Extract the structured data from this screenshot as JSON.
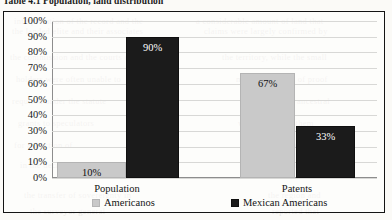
{
  "caption": "Table 4.1  Population, land distribution",
  "chart_data": {
    "type": "bar",
    "title": "",
    "xlabel": "",
    "ylabel": "",
    "categories": [
      "Population",
      "Patents"
    ],
    "series": [
      {
        "name": "Americanos",
        "color": "#c9c9c9",
        "values": [
          10,
          67
        ],
        "labels": [
          "10%",
          "67%"
        ]
      },
      {
        "name": "Mexican Americans",
        "color": "#1b1b1b",
        "values": [
          90,
          33
        ],
        "labels": [
          "90%",
          "33%"
        ]
      }
    ],
    "ylim": [
      0,
      100
    ],
    "ytick_labels": [
      "100%",
      "90%",
      "80%",
      "70%",
      "60%",
      "50%",
      "40%",
      "30%",
      "20%",
      "10%",
      "0%"
    ],
    "ytick_values": [
      100,
      90,
      80,
      70,
      60,
      50,
      40,
      30,
      20,
      10,
      0
    ],
    "grid": true,
    "legend_position": "bottom"
  },
  "ghost_text": [
    {
      "t": "interpretation of the record and the",
      "x": 14,
      "y": 16
    },
    {
      "t": "a considerable amount of land that",
      "x": 196,
      "y": 16
    },
    {
      "t": "the landed elite and their associates",
      "x": 12,
      "y": 26
    },
    {
      "t": "claims were largely confirmed by",
      "x": 204,
      "y": 26
    },
    {
      "t": "the commission and the courts of",
      "x": 10,
      "y": 52
    },
    {
      "t": "the territory, while the small",
      "x": 222,
      "y": 52
    },
    {
      "t": "holders were often unable to",
      "x": 16,
      "y": 74
    },
    {
      "t": "meet the burden of proof",
      "x": 236,
      "y": 74
    },
    {
      "t": "required under the statute",
      "x": 12,
      "y": 96
    },
    {
      "t": "and lost their ancestral",
      "x": 246,
      "y": 96
    },
    {
      "t": "grants to speculators",
      "x": 18,
      "y": 118
    },
    {
      "t": "who purchased them",
      "x": 238,
      "y": 118
    },
    {
      "t": "for a fraction of",
      "x": 14,
      "y": 140
    },
    {
      "t": "their actual worth",
      "x": 244,
      "y": 140
    },
    {
      "t": "in the decades",
      "x": 20,
      "y": 160
    },
    {
      "t": "that followed",
      "x": 250,
      "y": 160
    },
    {
      "t": "the transfer of sovereignty in",
      "x": 24,
      "y": 190
    },
    {
      "t": "the region and",
      "x": 268,
      "y": 190
    },
    {
      "t": "the surveyor general",
      "x": 30,
      "y": 206
    },
    {
      "t": "reported that",
      "x": 272,
      "y": 206
    }
  ]
}
